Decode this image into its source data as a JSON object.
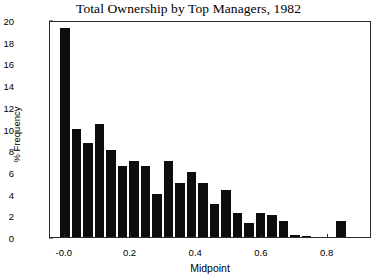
{
  "chart_data": {
    "type": "bar",
    "title": "Total Ownership by Top Managers, 1982",
    "xlabel": "Midpoint",
    "ylabel": "% Frequency",
    "xlim": [
      -0.045,
      0.935
    ],
    "ylim": [
      0,
      20
    ],
    "grid": false,
    "legend": null,
    "bar_style": "histogram",
    "x_ticks": [
      {
        "value": 0.0,
        "label": "-0.0"
      },
      {
        "value": 0.2,
        "label": "0.2"
      },
      {
        "value": 0.4,
        "label": "0.4"
      },
      {
        "value": 0.6,
        "label": "0.6"
      },
      {
        "value": 0.8,
        "label": "0.8"
      }
    ],
    "y_ticks": [
      {
        "value": 0,
        "label": "0"
      },
      {
        "value": 2,
        "label": "2"
      },
      {
        "value": 4,
        "label": "4"
      },
      {
        "value": 6,
        "label": "6"
      },
      {
        "value": 8,
        "label": "8"
      },
      {
        "value": 10,
        "label": "10"
      },
      {
        "value": 12,
        "label": "12"
      },
      {
        "value": 14,
        "label": "14"
      },
      {
        "value": 16,
        "label": "16"
      },
      {
        "value": 18,
        "label": "18"
      },
      {
        "value": 20,
        "label": "20"
      }
    ],
    "bin_width": 0.035,
    "categories": [
      "0.00",
      "0.035",
      "0.07",
      "0.105",
      "0.14",
      "0.175",
      "0.21",
      "0.245",
      "0.28",
      "0.315",
      "0.35",
      "0.385",
      "0.42",
      "0.455",
      "0.49",
      "0.525",
      "0.56",
      "0.595",
      "0.63",
      "0.665",
      "0.70",
      "0.735",
      "0.77",
      "0.805",
      "0.84",
      "0.875"
    ],
    "x": [
      0.0,
      0.035,
      0.07,
      0.105,
      0.14,
      0.175,
      0.21,
      0.245,
      0.28,
      0.315,
      0.35,
      0.385,
      0.42,
      0.455,
      0.49,
      0.525,
      0.56,
      0.595,
      0.63,
      0.665,
      0.7,
      0.735,
      0.77,
      0.805,
      0.84,
      0.875
    ],
    "values": [
      19.3,
      10.0,
      8.7,
      10.4,
      8.0,
      6.5,
      7.0,
      6.5,
      4.0,
      7.0,
      5.0,
      6.0,
      5.0,
      3.0,
      4.3,
      2.2,
      1.3,
      2.2,
      2.0,
      1.5,
      0.2,
      0.1,
      0.0,
      0.0,
      1.5,
      0.0
    ],
    "colors": {
      "bar": "#0d0d0d",
      "axis": "#2b2b2b",
      "background": "#ffffff",
      "text": "#000000"
    }
  }
}
